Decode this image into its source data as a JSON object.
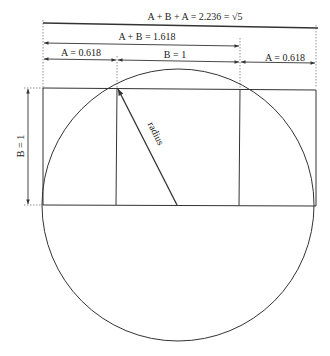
{
  "diagram": {
    "title_label": "A + B + A = 2.236 = √5",
    "ab_label": "A + B = 1.618",
    "a_left_label": "A = 0.618",
    "b_label": "B = 1",
    "a_right_label": "A = 0.618",
    "b_vertical_label": "B = 1",
    "radius_label": "radius",
    "colors": {
      "line": "#333333",
      "dotted": "#777777",
      "background": "#ffffff"
    }
  }
}
